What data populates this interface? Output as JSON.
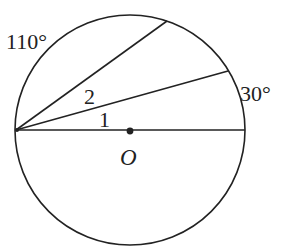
{
  "diagram": {
    "type": "geometry-circle-inscribed-angles",
    "circle": {
      "cx": 130,
      "cy": 130,
      "r": 115
    },
    "center": {
      "label": "O",
      "x": 130,
      "y": 130
    },
    "vertex": {
      "x": 16,
      "y": 130
    },
    "diameter": {
      "x1": 16,
      "y1": 130,
      "x2": 245,
      "y2": 130
    },
    "chords": [
      {
        "name": "upper-chord",
        "x1": 16,
        "y1": 130,
        "x2": 167,
        "y2": 21
      },
      {
        "name": "lower-chord",
        "x1": 16,
        "y1": 130,
        "x2": 228,
        "y2": 71
      }
    ],
    "labels": {
      "arc_110": "110°",
      "arc_30": "30°",
      "angle_1": "1",
      "angle_2": "2",
      "center": "O"
    },
    "colors": {
      "stroke": "#222222",
      "background": "#ffffff"
    }
  }
}
